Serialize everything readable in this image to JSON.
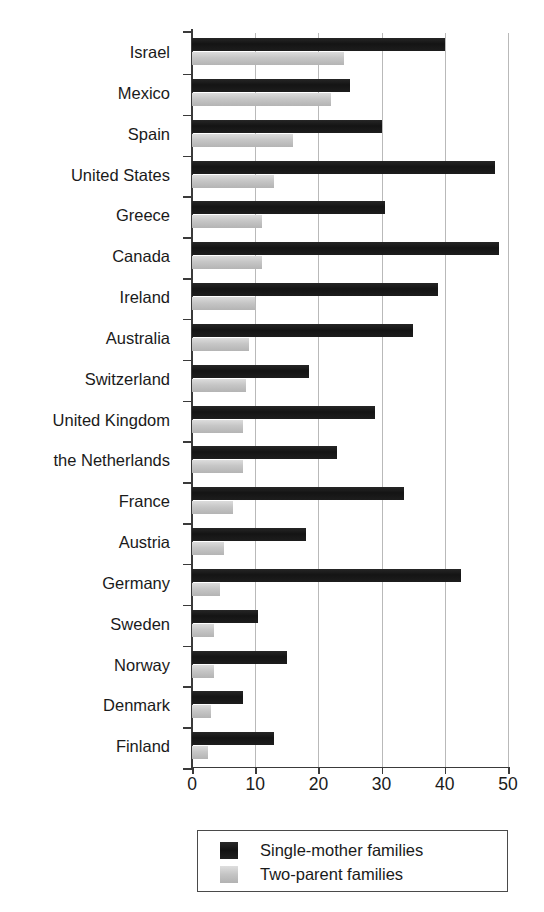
{
  "chart_data": {
    "type": "bar",
    "orientation": "horizontal",
    "title": "",
    "subtitle": "",
    "xlabel": "",
    "ylabel": "",
    "xlim": [
      0,
      50
    ],
    "xticks": [
      0,
      10,
      20,
      30,
      40,
      50
    ],
    "xtick_labels": [
      "0",
      "10",
      "20",
      "30",
      "40",
      "50"
    ],
    "grid": "vertical",
    "legend_position": "bottom-center",
    "categories": [
      "Israel",
      "Mexico",
      "Spain",
      "United States",
      "Greece",
      "Canada",
      "Ireland",
      "Australia",
      "Switzerland",
      "United Kingdom",
      "the Netherlands",
      "France",
      "Austria",
      "Germany",
      "Sweden",
      "Norway",
      "Denmark",
      "Finland"
    ],
    "series": [
      {
        "name": "Single-mother families",
        "color": "#141414",
        "values": [
          40,
          25,
          30,
          48,
          30.5,
          48.5,
          39,
          35,
          18.5,
          29,
          23,
          33.5,
          18,
          42.5,
          10.5,
          15,
          8,
          13
        ]
      },
      {
        "name": "Two-parent families",
        "color": "#c6c6c6",
        "values": [
          24,
          22,
          16,
          13,
          11,
          11,
          10,
          9,
          8.5,
          8,
          8,
          6.5,
          5,
          4.5,
          3.5,
          3.5,
          3,
          2.5
        ]
      }
    ]
  },
  "legend": {
    "entries": [
      {
        "label": "Single-mother families",
        "swatch": "dark"
      },
      {
        "label": "Two-parent families",
        "swatch": "light"
      }
    ]
  },
  "colors": {
    "dark_bar": "#141414",
    "light_bar": "#c6c6c6",
    "gridline": "#b9b9b9",
    "axis": "#3a3a3a",
    "text": "#1a1a1a",
    "background": "#ffffff"
  }
}
